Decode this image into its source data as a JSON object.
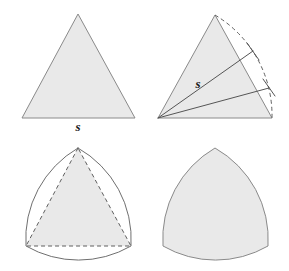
{
  "figure": {
    "background_color": "#ffffff",
    "fill_color": "#e9e9e9",
    "stroke_color": "#8a8a8a",
    "dash_color": "#5f5f5f",
    "label_color": "#1a1a1a",
    "width": 289,
    "height": 271
  },
  "panels": [
    {
      "id": "panel-top-left",
      "name": "equilateral-triangle",
      "caption": "Equilateral triangle of side s",
      "label": "s",
      "label_x": 78,
      "label_y": 130,
      "vertices": [
        {
          "x": 78,
          "y": 14
        },
        {
          "x": 22,
          "y": 118
        },
        {
          "x": 135,
          "y": 118
        }
      ]
    },
    {
      "id": "panel-top-right",
      "name": "arc-construction",
      "caption": "Arc of radius s swung from the opposite vertex",
      "label": "s",
      "label_x": 198,
      "label_y": 84,
      "vertices": [
        {
          "x": 215,
          "y": 15
        },
        {
          "x": 158,
          "y": 118
        },
        {
          "x": 272,
          "y": 118
        }
      ],
      "radius": 114,
      "radius_lines": [
        {
          "x1": 158,
          "y1": 118,
          "x2": 252,
          "y2": 53
        },
        {
          "x1": 158,
          "y1": 118,
          "x2": 268,
          "y2": 88
        }
      ],
      "ticks": [
        {
          "x1": 246,
          "y1": 45,
          "x2": 258,
          "y2": 61
        },
        {
          "x1": 262,
          "y1": 80,
          "x2": 274,
          "y2": 96
        }
      ]
    },
    {
      "id": "panel-bottom-left",
      "name": "three-arcs-overlay",
      "caption": "Three arcs drawn over the dashed triangle",
      "label": "",
      "vertices": [
        {
          "x": 78,
          "y": 148
        },
        {
          "x": 26,
          "y": 246
        },
        {
          "x": 131,
          "y": 246
        }
      ]
    },
    {
      "id": "panel-bottom-right",
      "name": "reuleaux-triangle",
      "caption": "Completed Reuleaux triangle",
      "label": "",
      "vertices": [
        {
          "x": 215,
          "y": 148
        },
        {
          "x": 163,
          "y": 246
        },
        {
          "x": 268,
          "y": 246
        }
      ]
    }
  ],
  "labels": {
    "side_s_top_left": "s",
    "radius_s_top_right": "s"
  }
}
